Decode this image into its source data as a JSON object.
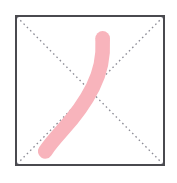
{
  "canvas": {
    "width": 177,
    "height": 183,
    "background_color": "#FFFFFF"
  },
  "grid": {
    "name": "character-practice-grid",
    "style": "mi-zi-ge-diagonals",
    "box": {
      "x": 15,
      "y": 15,
      "width": 150,
      "height": 151,
      "border_color": "#4A4A4F",
      "border_width_px": 2,
      "fill_color": "#FFFFFF"
    },
    "guides": [
      {
        "name": "diagonal-guide-top-left-to-bottom-right",
        "from": [
          0,
          0
        ],
        "to": [
          150,
          151
        ],
        "style": "dotted",
        "color": "#8C8C96",
        "width_px": 1.4,
        "dash": "1.6 3.2"
      },
      {
        "name": "diagonal-guide-top-right-to-bottom-left",
        "from": [
          150,
          0
        ],
        "to": [
          0,
          151
        ],
        "style": "dotted",
        "color": "#8C8C96",
        "width_px": 1.4,
        "dash": "1.6 3.2"
      }
    ]
  },
  "character": {
    "stroke_name": "pie",
    "stroke_label": "丿",
    "stroke_count": 1,
    "strokes": [
      {
        "name": "pie-stroke",
        "order": 1,
        "color": "#F8B4BC",
        "head": {
          "x": 88,
          "y": 22,
          "radius": 9
        },
        "tail": {
          "x": 30,
          "y": 139
        },
        "path": "M 88 24 C 89 42, 86 56, 78 72 C 70 88, 58 104, 46 117 C 38 126, 33 132, 29 138",
        "head_width_px": 15,
        "tail_width_px": 10
      }
    ]
  }
}
